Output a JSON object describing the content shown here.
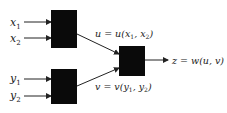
{
  "diagram": {
    "inputs": {
      "x1": {
        "base": "x",
        "sub": "1"
      },
      "x2": {
        "base": "x",
        "sub": "2"
      },
      "y1": {
        "base": "y",
        "sub": "1"
      },
      "y2": {
        "base": "y",
        "sub": "2"
      }
    },
    "intermediate": {
      "u": {
        "pre": "u = u(x",
        "s1": "1",
        "mid": ", x",
        "s2": "2",
        "post": ")"
      },
      "v": {
        "pre": "v = v(y",
        "s1": "1",
        "mid": ", y",
        "s2": "2",
        "post": ")"
      }
    },
    "output": {
      "label": "z = w(u, v)"
    },
    "colors": {
      "box": "#0a0a0a",
      "line": "#222222",
      "text": "#222222"
    }
  }
}
